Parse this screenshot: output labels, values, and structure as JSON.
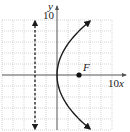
{
  "chart_data": {
    "type": "line",
    "title": "",
    "xlabel": "x",
    "ylabel": "y",
    "xlim": [
      -10,
      10
    ],
    "ylim": [
      -10,
      10
    ],
    "grid": true,
    "grid_step": 2,
    "tick_labels": {
      "x": "10",
      "y": "10"
    },
    "series": [
      {
        "name": "parabola",
        "equation": "y^2 = 16x",
        "style": "solid",
        "arrows": "both-ends",
        "y_range": [
          -9.8,
          9.8
        ]
      },
      {
        "name": "directrix",
        "equation": "x = -4",
        "style": "dashed",
        "arrows": "both-ends",
        "y_range": [
          -10,
          10
        ]
      }
    ],
    "points": [
      {
        "label": "F",
        "x": 4,
        "y": 0
      }
    ]
  }
}
